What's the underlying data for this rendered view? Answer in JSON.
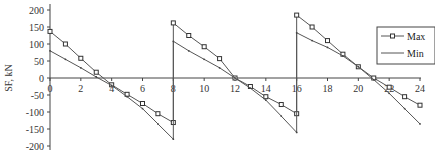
{
  "chart_data": {
    "type": "line",
    "title": "",
    "xlabel": "",
    "ylabel": "SF, kN",
    "xlim": [
      0,
      24
    ],
    "ylim": [
      -200,
      200
    ],
    "x_ticks": [
      0,
      2,
      4,
      6,
      8,
      10,
      12,
      14,
      16,
      18,
      20,
      22,
      24
    ],
    "y_ticks": [
      200,
      150,
      100,
      50,
      0,
      -50,
      -100,
      -150,
      -200
    ],
    "legend_position": "right",
    "series": [
      {
        "name": "Max",
        "marker": "square",
        "x": [
          0,
          1,
          2,
          3,
          4,
          5,
          6,
          7,
          8,
          8,
          9,
          10,
          11,
          12,
          13,
          14,
          15,
          16,
          16,
          17,
          18,
          19,
          20,
          21,
          22,
          23,
          24
        ],
        "values": [
          137,
          100,
          58,
          17,
          -20,
          -48,
          -75,
          -105,
          -131,
          162,
          125,
          92,
          57,
          0,
          -25,
          -55,
          -78,
          -105,
          185,
          150,
          110,
          70,
          33,
          0,
          -27,
          -55,
          -80
        ]
      },
      {
        "name": "Min",
        "marker": "x",
        "x": [
          0,
          1,
          2,
          3,
          4,
          5,
          6,
          7,
          8,
          8,
          9,
          10,
          11,
          12,
          13,
          14,
          15,
          16,
          16,
          17,
          18,
          19,
          20,
          21,
          22,
          23,
          24
        ],
        "values": [
          80,
          55,
          30,
          3,
          -22,
          -55,
          -90,
          -135,
          -180,
          108,
          80,
          55,
          30,
          0,
          -30,
          -65,
          -112,
          -160,
          133,
          110,
          90,
          65,
          33,
          -5,
          -45,
          -90,
          -135
        ]
      }
    ]
  },
  "legend": {
    "max": "Max",
    "min": "Min"
  },
  "axis": {
    "ylabel": "SF, kN"
  }
}
